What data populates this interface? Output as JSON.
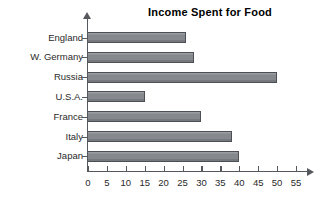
{
  "chart_data": {
    "type": "bar",
    "orientation": "horizontal",
    "title": "Income Spent for Food",
    "xlabel": "",
    "ylabel": "",
    "categories": [
      "England",
      "W. Germany",
      "Russia",
      "U.S.A.",
      "France",
      "Italy",
      "Japan"
    ],
    "values": [
      26,
      28,
      50,
      15,
      30,
      38,
      40
    ],
    "xlim": [
      0,
      55
    ],
    "xticks": [
      0,
      5,
      10,
      15,
      20,
      25,
      30,
      35,
      40,
      45,
      50,
      55
    ],
    "xtick_labels": [
      "0",
      "5",
      "10",
      "15",
      "20",
      "25",
      "30",
      "35",
      "40",
      "45",
      "50",
      "55"
    ],
    "grid": false,
    "legend": null,
    "bar_color": "#85888c",
    "bar_border_color": "#4c4f53",
    "axis_color": "#55585c",
    "background": "#ffffff"
  }
}
